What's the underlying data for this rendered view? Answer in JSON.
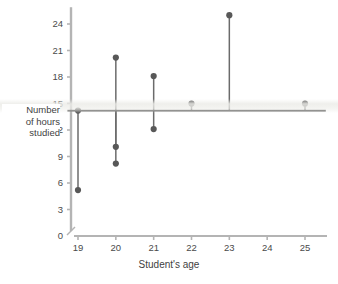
{
  "chart_data": {
    "type": "scatter",
    "title": "",
    "xlabel": "Student's age",
    "ylabel": "Number of hours studied",
    "ylabel_lines": [
      "Number",
      "of hours",
      "studied"
    ],
    "x": [
      19,
      19,
      20,
      20,
      20,
      21,
      21,
      22,
      23,
      25
    ],
    "y": [
      14.2,
      5.2,
      20.2,
      10.1,
      8.2,
      18.1,
      12.1,
      15.0,
      25.0,
      15.0
    ],
    "points": [
      {
        "x": 19,
        "y": 14.2
      },
      {
        "x": 19,
        "y": 5.2
      },
      {
        "x": 20,
        "y": 20.2
      },
      {
        "x": 20,
        "y": 10.1
      },
      {
        "x": 20,
        "y": 8.2
      },
      {
        "x": 21,
        "y": 18.1
      },
      {
        "x": 21,
        "y": 12.1
      },
      {
        "x": 22,
        "y": 15.0
      },
      {
        "x": 23,
        "y": 25.0
      },
      {
        "x": 25,
        "y": 15.0
      }
    ],
    "fit_line": {
      "type": "horizontal",
      "y": 14.2,
      "x_start": 18.72,
      "x_end": 25.55,
      "label": ""
    },
    "residual_stems": true,
    "xticks": [
      19,
      20,
      21,
      22,
      23,
      24,
      25
    ],
    "xticklabels": [
      "19",
      "20",
      "21",
      "22",
      "23",
      "24",
      "25"
    ],
    "yticks": [
      0,
      3,
      6,
      9,
      12,
      15,
      18,
      21,
      24
    ],
    "yticklabels": [
      "0",
      "3",
      "6",
      "9",
      "12",
      "15",
      "18",
      "21",
      "24"
    ],
    "xlim": [
      18.55,
      25.7
    ],
    "ylim": [
      0,
      25.9
    ],
    "grid": false,
    "legend": null,
    "axis_break_y": true,
    "colors": {
      "point": "#585858",
      "stem": "#6b6b6b",
      "fit_line": "#4f4f4f",
      "axis": "#b4b4b4",
      "tick_text": "#4a4a4a",
      "background": "#ffffff"
    }
  }
}
